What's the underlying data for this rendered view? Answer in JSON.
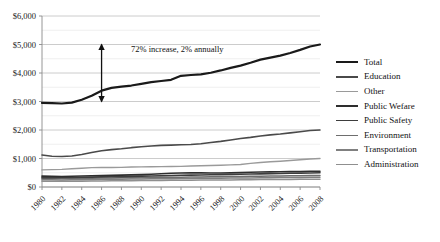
{
  "chart_data": {
    "type": "line",
    "title": "",
    "xlabel": "",
    "ylabel": "",
    "x": [
      1980,
      1981,
      1982,
      1983,
      1984,
      1985,
      1986,
      1987,
      1988,
      1989,
      1990,
      1991,
      1992,
      1993,
      1994,
      1995,
      1996,
      1997,
      1998,
      1999,
      2000,
      2001,
      2002,
      2003,
      2004,
      2005,
      2006,
      2007,
      2008
    ],
    "tick_labels_x": [
      "1980",
      "1982",
      "1984",
      "1986",
      "1988",
      "1990",
      "1992",
      "1994",
      "1996",
      "1998",
      "2000",
      "2002",
      "2004",
      "2006",
      "2008"
    ],
    "tick_labels_y": [
      "$0",
      "$1,000",
      "$2,000",
      "$3,000",
      "$4,000",
      "$5,000",
      "$6,000"
    ],
    "ylim": [
      0,
      6000
    ],
    "xlim": [
      1980,
      2008
    ],
    "ytick_step": 1000,
    "minor_gridline_step": 500,
    "grid": true,
    "legend_position": "right",
    "annotations": [
      {
        "text": "72% increase, 2% annually",
        "x": 1986,
        "y_top": 5000,
        "y_bottom": 3000,
        "arrow": "double-headed-vertical"
      }
    ],
    "series": [
      {
        "name": "Total",
        "color": "#1a1a1a",
        "width": 2.2,
        "values": [
          2950,
          2940,
          2930,
          2960,
          3060,
          3200,
          3380,
          3480,
          3520,
          3560,
          3620,
          3680,
          3720,
          3760,
          3900,
          3930,
          3950,
          4010,
          4090,
          4180,
          4260,
          4360,
          4470,
          4540,
          4610,
          4700,
          4810,
          4930,
          5000
        ]
      },
      {
        "name": "Education",
        "color": "#4a4a4a",
        "width": 1.6,
        "values": [
          1120,
          1080,
          1070,
          1090,
          1140,
          1210,
          1270,
          1310,
          1340,
          1380,
          1410,
          1440,
          1460,
          1470,
          1480,
          1490,
          1520,
          1560,
          1600,
          1650,
          1700,
          1740,
          1790,
          1830,
          1860,
          1900,
          1940,
          1980,
          2000
        ]
      },
      {
        "name": "Other",
        "color": "#9a9a9a",
        "width": 1.4,
        "values": [
          600,
          610,
          620,
          640,
          660,
          680,
          690,
          685,
          690,
          700,
          705,
          710,
          715,
          720,
          725,
          735,
          745,
          755,
          765,
          775,
          790,
          830,
          860,
          885,
          905,
          930,
          955,
          980,
          1000
        ]
      },
      {
        "name": "Public Wefare",
        "color": "#2e2e2e",
        "width": 1.6,
        "values": [
          380,
          375,
          370,
          375,
          385,
          395,
          405,
          410,
          415,
          425,
          435,
          450,
          465,
          480,
          490,
          495,
          495,
          490,
          490,
          495,
          505,
          515,
          525,
          530,
          535,
          540,
          545,
          550,
          555
        ]
      },
      {
        "name": "Public Safety",
        "color": "#3d3d3d",
        "width": 1.6,
        "values": [
          330,
          330,
          332,
          335,
          340,
          348,
          355,
          360,
          365,
          372,
          380,
          388,
          395,
          402,
          410,
          416,
          422,
          428,
          434,
          440,
          447,
          455,
          462,
          468,
          474,
          480,
          486,
          492,
          498
        ]
      },
      {
        "name": "Environment",
        "color": "#6e6e6e",
        "width": 1.5,
        "values": [
          300,
          298,
          296,
          298,
          302,
          308,
          314,
          318,
          322,
          326,
          330,
          334,
          338,
          342,
          346,
          350,
          354,
          358,
          362,
          366,
          370,
          375,
          380,
          384,
          388,
          392,
          396,
          400,
          404
        ]
      },
      {
        "name": "Transportation",
        "color": "#808080",
        "width": 1.5,
        "values": [
          255,
          252,
          250,
          252,
          256,
          262,
          268,
          272,
          275,
          278,
          282,
          286,
          290,
          293,
          296,
          300,
          303,
          306,
          309,
          312,
          316,
          320,
          324,
          327,
          330,
          333,
          336,
          339,
          342
        ]
      },
      {
        "name": "Administration",
        "color": "#8f8f8f",
        "width": 1.5,
        "values": [
          205,
          203,
          202,
          203,
          206,
          210,
          214,
          217,
          220,
          222,
          225,
          228,
          231,
          234,
          237,
          240,
          243,
          245,
          248,
          250,
          253,
          256,
          259,
          262,
          264,
          267,
          270,
          272,
          275
        ]
      }
    ]
  },
  "legend": {
    "items": [
      "Total",
      "Education",
      "Other",
      "Public Wefare",
      "Public Safety",
      "Environment",
      "Transportation",
      "Administration"
    ]
  }
}
